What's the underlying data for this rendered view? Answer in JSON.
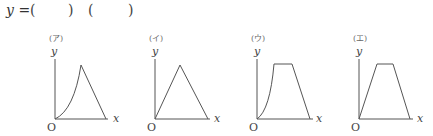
{
  "question": {
    "lhs": "y",
    "equals": "=",
    "blank1_open": "(",
    "blank1_close": ")",
    "blank2_open": "(",
    "blank2_close": ")"
  },
  "graphs": [
    {
      "tag": "(ア)",
      "shape": "curved rise (concave up) to a peak, then straight linear fall to x-axis",
      "y_label": "y",
      "x_label": "x",
      "origin_label": "O"
    },
    {
      "tag": "(イ)",
      "shape": "straight linear rise to a peak, then straight linear fall (triangle)",
      "y_label": "y",
      "x_label": "x",
      "origin_label": "O"
    },
    {
      "tag": "(ウ)",
      "shape": "curved rise (concave up), flat plateau, then straight linear fall",
      "y_label": "y",
      "x_label": "x",
      "origin_label": "O"
    },
    {
      "tag": "(エ)",
      "shape": "straight linear rise, flat plateau, then straight linear fall (trapezoid)",
      "y_label": "y",
      "x_label": "x",
      "origin_label": "O"
    }
  ],
  "colors": {
    "line": "#555555",
    "text": "#444444"
  }
}
